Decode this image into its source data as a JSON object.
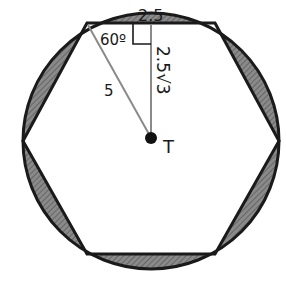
{
  "diagram": {
    "center_label": "T",
    "labels": {
      "half_side": "2.5",
      "angle": "60º",
      "radius": "5",
      "apothem": "2.5√3"
    },
    "colors": {
      "stroke": "#1a1a1a",
      "segment_fill": "#7a7a7a",
      "construction_line": "#8a8a8a",
      "background": "#ffffff"
    },
    "shaded_regions": "circular segments between hexagon sides and circle"
  }
}
